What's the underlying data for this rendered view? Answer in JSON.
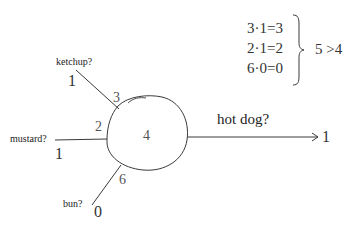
{
  "diagram": {
    "type": "perceptron",
    "inputs": [
      {
        "name": "ketchup",
        "label": "ketchup?",
        "value": "1",
        "weight": "3"
      },
      {
        "name": "mustard",
        "label": "mustard?",
        "value": "1",
        "weight": "2"
      },
      {
        "name": "bun",
        "label": "bun?",
        "value": "0",
        "weight": "6"
      }
    ],
    "neuron": {
      "threshold": "4"
    },
    "output": {
      "label": "hot dog?",
      "value": "1"
    },
    "computation": {
      "lines": [
        "3·1=3",
        "2·1=2",
        "6·0=0"
      ],
      "comparison": "5 >4"
    },
    "colors": {
      "stroke": "#3a3a3a",
      "text": "#2b2b2b",
      "weight_text": "#555555",
      "background": "#ffffff"
    }
  }
}
